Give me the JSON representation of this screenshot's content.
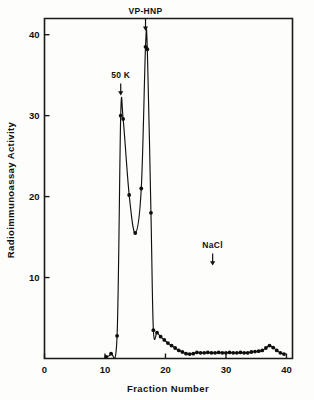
{
  "figure": {
    "background_color": "#fdfdfb",
    "ink_color": "#111111"
  },
  "chart_data": {
    "type": "line",
    "title": "",
    "subtitle": "",
    "xlabel": "Fraction  Number",
    "ylabel": "Radioimmunoassay  Activity",
    "xlim": [
      0,
      41
    ],
    "ylim": [
      0,
      42
    ],
    "xticks": [
      0,
      10,
      20,
      30,
      40
    ],
    "xtick_labels": [
      "0",
      "10",
      "20",
      "30",
      "40"
    ],
    "yticks": [
      10,
      20,
      30,
      40
    ],
    "ytick_labels": [
      "10",
      "20",
      "30",
      "40"
    ],
    "grid": false,
    "legend": "none",
    "marker": "filled-circle",
    "line_style": "solid",
    "series": [
      {
        "name": "Radioimmunoassay Activity",
        "x": [
          10.2,
          11.0,
          12.0,
          12.6,
          13.0,
          14.0,
          15.0,
          16.0,
          16.7,
          17.0,
          17.6,
          18.0,
          18.6,
          19.2,
          19.8,
          20.4,
          21.0,
          21.6,
          22.2,
          22.8,
          23.4,
          24.0,
          24.6,
          25.2,
          25.8,
          26.4,
          27.0,
          27.6,
          28.2,
          28.8,
          29.4,
          30.0,
          30.6,
          31.2,
          31.8,
          32.4,
          33.0,
          33.6,
          34.2,
          34.8,
          35.4,
          36.0,
          36.6,
          37.2,
          37.8,
          38.4,
          39.0,
          39.6
        ],
        "y": [
          0.2,
          0.6,
          2.8,
          30.0,
          29.6,
          20.2,
          15.5,
          21.0,
          38.5,
          38.2,
          18.0,
          3.5,
          3.2,
          2.7,
          2.3,
          1.9,
          1.6,
          1.3,
          1.0,
          0.8,
          0.6,
          0.55,
          0.6,
          0.75,
          0.7,
          0.7,
          0.75,
          0.7,
          0.7,
          0.75,
          0.7,
          0.7,
          0.75,
          0.7,
          0.7,
          0.75,
          0.7,
          0.7,
          0.8,
          0.85,
          0.9,
          1.0,
          1.3,
          1.6,
          1.35,
          1.0,
          0.7,
          0.55
        ]
      }
    ],
    "annotations": [
      {
        "label": "50 K",
        "x": 12.6,
        "y": 30.0,
        "arrow": "down",
        "label_y_value": 34.6
      },
      {
        "label": "VP-HNP",
        "x": 16.7,
        "y": 38.5,
        "arrow": "down",
        "label_y_value": 42.6
      },
      {
        "label": "NaCl",
        "x": 27.8,
        "y": 0.7,
        "arrow": "down",
        "label_y_value": 13.6
      }
    ]
  }
}
